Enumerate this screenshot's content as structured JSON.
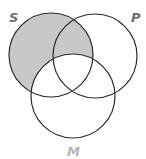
{
  "diagram": {
    "type": "venn",
    "sets": [
      {
        "id": "S",
        "label": "S",
        "cx": 51,
        "cy": 55,
        "r": 42,
        "label_x": 9,
        "label_y": 22,
        "label_color": "#6d6d6d"
      },
      {
        "id": "P",
        "label": "P",
        "cx": 95,
        "cy": 56,
        "r": 42,
        "label_x": 131,
        "label_y": 22,
        "label_color": "#6d6d6d"
      },
      {
        "id": "M",
        "label": "M",
        "cx": 73,
        "cy": 96,
        "r": 42,
        "label_x": 67,
        "label_y": 156,
        "label_color": "#b5b5b5"
      }
    ],
    "shaded_region": "S minus M",
    "colors": {
      "shade": "#c8c8c8",
      "stroke": "#2a2a2a",
      "background": "#ffffff"
    }
  }
}
